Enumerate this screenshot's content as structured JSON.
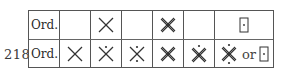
{
  "page_number": "218",
  "table": {
    "row_labels": [
      "Ord.",
      "Ord."
    ],
    "rows": [
      {
        "label": "Ord.",
        "cells": [
          {
            "symbol": "empty"
          },
          {
            "symbol": "single-cross"
          },
          {
            "symbol": "empty"
          },
          {
            "symbol": "double-cross"
          },
          {
            "symbol": "empty"
          },
          {
            "symbol": "boxed-dot"
          }
        ]
      },
      {
        "label": "Ord.",
        "cells": [
          {
            "symbol": "single-cross"
          },
          {
            "symbol": "single-cross-dot-top"
          },
          {
            "symbol": "single-cross-dots-top-bottom"
          },
          {
            "symbol": "double-cross"
          },
          {
            "symbol": "double-cross-dot-top"
          },
          {
            "symbol": "double-cross-dots-top-bottom-or-boxed-dot",
            "connector": "or"
          }
        ]
      }
    ]
  },
  "colors": {
    "ink": "#2a2a2a",
    "rule": "#555555"
  }
}
